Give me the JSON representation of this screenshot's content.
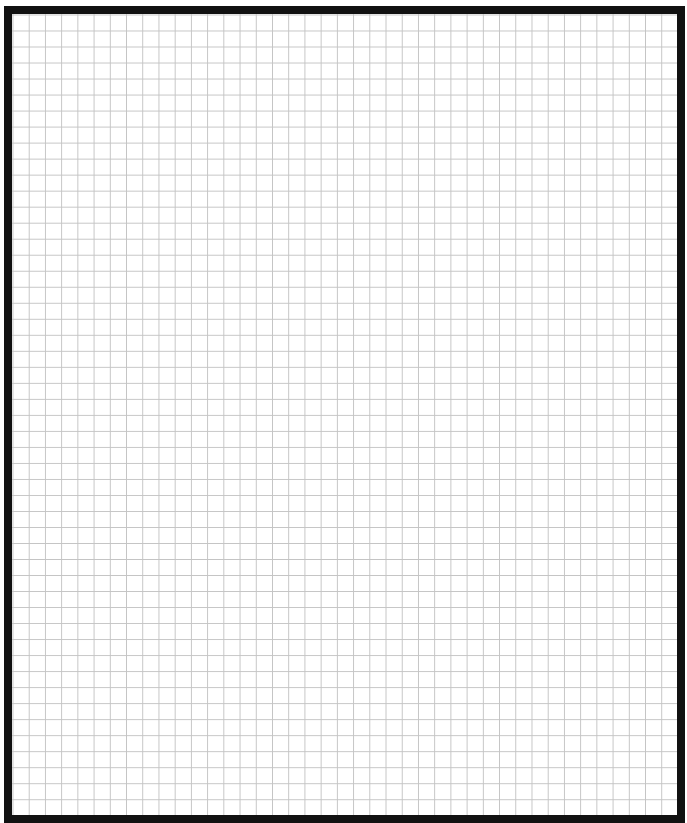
{
  "page": {
    "type": "grid-paper",
    "border_color": "#111111",
    "grid_line_color": "#c4c4c4",
    "background_color": "#ffffff",
    "grid": {
      "columns": 41,
      "rows": 50,
      "cell_size_px": 16
    }
  }
}
